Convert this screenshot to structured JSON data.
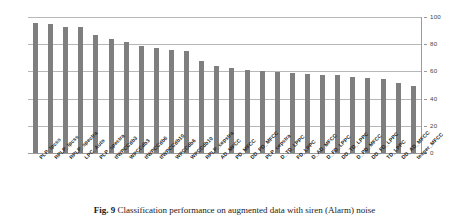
{
  "caption": {
    "label": "Fig. 9",
    "text": "Classification performance on augmented data with siren (Alarm) noise"
  },
  "axis": {
    "value_ticks": [
      "0",
      "20",
      "40",
      "60",
      "80",
      "100"
    ]
  },
  "colors": {
    "bar": "#7f7f7f",
    "gridline": "#b7b7b7",
    "text": "#262626"
  },
  "chart_data": {
    "type": "bar",
    "title": "",
    "subtitle": "",
    "xlabel": "",
    "ylabel": "",
    "ylim": [
      0,
      100
    ],
    "yticks": [
      0,
      20,
      40,
      60,
      80,
      100
    ],
    "grid": true,
    "legend": false,
    "categories": [
      "PLP_lpcss",
      "RPLP_lpcss",
      "RPLP_spectra",
      "LPC_Auto",
      "PLP_spectra",
      "tfWPCCdb3",
      "WPCCdb3",
      "tfWPCCdb6",
      "tfWPCCdb10",
      "WPCCdb6",
      "WPCCdb10",
      "RPLP_cepstra",
      "AD_MFCC",
      "PD_MFCC",
      "DD_PD_MFCC",
      "PLP_cepstra",
      "D_TD_LPPC",
      "FD_LPPC",
      "D_AD_MFCC",
      "D_FD_LPPC",
      "DD_TD_LPPC",
      "D_PD_MFCC",
      "DD_FD_LPPC",
      "TD_LPPC",
      "DD_AD_MFCC",
      "teager_MFCC"
    ],
    "values": [
      95.5,
      95.2,
      93.0,
      92.9,
      87.0,
      83.5,
      81.8,
      78.9,
      77.2,
      75.5,
      74.8,
      67.3,
      64.0,
      62.6,
      60.7,
      60.6,
      59.5,
      58.8,
      58.4,
      57.3,
      57.0,
      56.2,
      54.8,
      54.3,
      51.7,
      49.6
    ]
  }
}
